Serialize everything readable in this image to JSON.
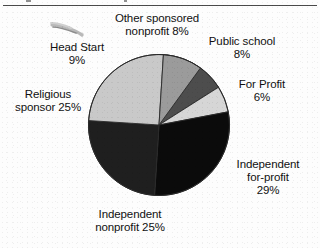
{
  "page": {
    "background_color": "#fdfdfd",
    "rule_color": "#4a4a4a"
  },
  "artifacts": {
    "pen_mark_name": "pen-scribble-artifact",
    "top_rule_name": "horizontal-rule"
  },
  "chart_data": {
    "type": "pie",
    "title": "",
    "subtitle": "",
    "xlabel": "",
    "ylabel": "",
    "legend_position": "none",
    "grid": false,
    "units": "percent",
    "total": 100,
    "start_angle_deg": 0,
    "direction": "clockwise",
    "categories": [
      "Other sponsored nonprofit",
      "Public school",
      "For Profit",
      "Independent for-profit",
      "Independent nonprofit",
      "Religious sponsor",
      "Head Start"
    ],
    "values": [
      8,
      8,
      6,
      29,
      25,
      25,
      9
    ],
    "colors": [
      "#e9e9e9",
      "#4d4d4d",
      "#d6d6d6",
      "#0b0b0b",
      "#1f1f1f",
      "#c9c9c9",
      "#9b9b9b"
    ],
    "slices": [
      {
        "name": "Other sponsored nonprofit",
        "value": 8,
        "color": "#e9e9e9",
        "label_lines": [
          "Other sponsored",
          "nonprofit 8%"
        ]
      },
      {
        "name": "Public school",
        "value": 8,
        "color": "#4d4d4d",
        "label_lines": [
          "Public school",
          "8%"
        ]
      },
      {
        "name": "For Profit",
        "value": 6,
        "color": "#d6d6d6",
        "label_lines": [
          "For Profit",
          "6%"
        ]
      },
      {
        "name": "Independent for-profit",
        "value": 29,
        "color": "#0b0b0b",
        "label_lines": [
          "Independent",
          "for-profit",
          "29%"
        ]
      },
      {
        "name": "Independent nonprofit",
        "value": 25,
        "color": "#1f1f1f",
        "label_lines": [
          "Independent",
          "nonprofit 25%"
        ]
      },
      {
        "name": "Religious sponsor",
        "value": 25,
        "color": "#c9c9c9",
        "label_lines": [
          "Religious",
          "sponsor 25%"
        ]
      },
      {
        "name": "Head Start",
        "value": 9,
        "color": "#9b9b9b",
        "label_lines": [
          "Head Start",
          "9%"
        ]
      }
    ]
  },
  "labels": {
    "other_sponsored": "Other sponsored\nnonprofit 8%",
    "public_school": "Public school\n8%",
    "for_profit": "For Profit\n6%",
    "independent_for_profit": "Independent\nfor-profit\n29%",
    "independent_nonprofit": "Independent\nnonprofit 25%",
    "religious_sponsor": "Religious\nsponsor 25%",
    "head_start": "Head Start\n9%"
  }
}
